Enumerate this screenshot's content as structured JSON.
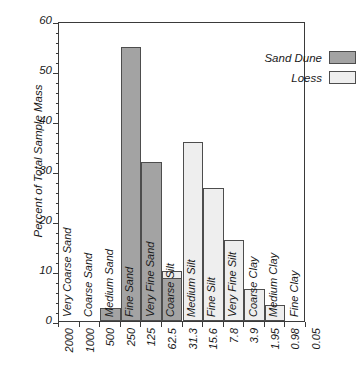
{
  "chart_data": {
    "type": "bar",
    "title": "",
    "xlabel": "",
    "ylabel": "Percent of Total Sample Mass",
    "ylim": [
      0,
      60
    ],
    "yticks": [
      0,
      10,
      20,
      30,
      40,
      50,
      60
    ],
    "ytick_labels": [
      "0",
      "10",
      "20",
      "30",
      "40",
      "50",
      "60"
    ],
    "y_minor_interval": 2,
    "grid": false,
    "legend_position": "top-right",
    "x_boundary_labels": [
      "2000",
      "1000",
      "500",
      "250",
      "125",
      "62.5",
      "31.3",
      "15.6",
      "7.8",
      "3.9",
      "1.95",
      "0.98",
      "0.05"
    ],
    "categories": [
      "Very Coarse Sand",
      "Coarse Sand",
      "Medium Sand",
      "Fine Sand",
      "Very Fine Sand",
      "Coarse Silt",
      "Medium Silt",
      "Fine Silt",
      "Very Fine Silt",
      "Coarse Clay",
      "Medium Clay",
      "Fine Clay"
    ],
    "series": [
      {
        "name": "Sand Dune",
        "color": "#a3a3a3",
        "values": [
          0,
          0,
          2.6,
          54.9,
          31.9,
          8.7,
          0,
          0,
          0,
          0,
          0,
          0
        ]
      },
      {
        "name": "Loess",
        "color": "#eeeeee",
        "values": [
          0,
          0,
          0,
          0,
          1.4,
          10.0,
          35.9,
          26.6,
          16.2,
          6.5,
          3.2,
          0
        ]
      }
    ]
  },
  "legend": {
    "items": [
      {
        "label": "Sand Dune",
        "swatch": "dune"
      },
      {
        "label": "Loess",
        "swatch": "loess"
      }
    ]
  },
  "axes": {
    "y_title": "Percent of Total Sample Mass"
  }
}
